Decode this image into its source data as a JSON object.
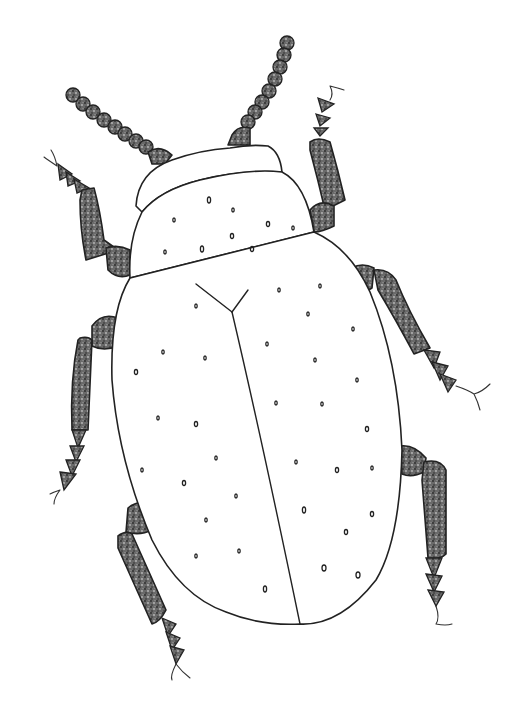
{
  "image": {
    "subject": "beetle illustration",
    "style": "pen-and-ink stippled drawing",
    "background_color": "#ffffff",
    "ink_color": "#222222",
    "parts": {
      "antennae": 2,
      "legs": 6,
      "elytra": 2
    }
  }
}
